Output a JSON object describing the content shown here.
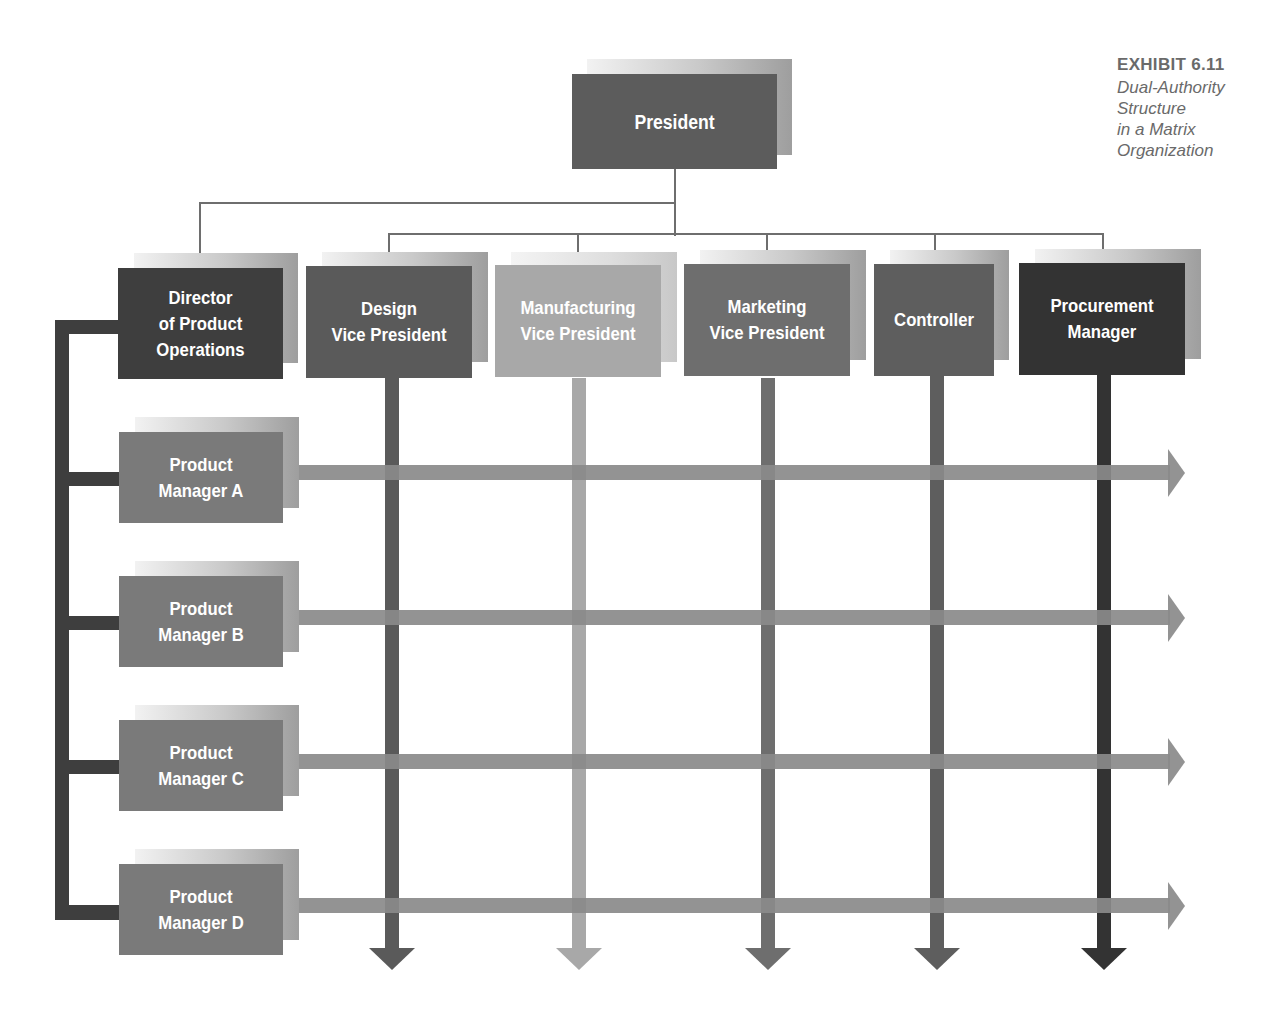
{
  "caption": {
    "exhibit": "EXHIBIT 6.11",
    "title_line1": "Dual-Authority Structure",
    "title_line2": "in a Matrix Organization"
  },
  "top": {
    "label": "President",
    "color": "#5c5c5c"
  },
  "executives": [
    {
      "label": "Director\nof Product\nOperations",
      "color": "#3e3e3e"
    },
    {
      "label": "Design\nVice President",
      "color": "#5a5a5a"
    },
    {
      "label": "Manufacturing\nVice President",
      "color": "#a8a8a8"
    },
    {
      "label": "Marketing\nVice President",
      "color": "#6e6e6e"
    },
    {
      "label": "Controller",
      "color": "#5e5e5e"
    },
    {
      "label": "Procurement\nManager",
      "color": "#333333"
    }
  ],
  "product_managers": [
    {
      "label": "Product\nManager A",
      "color": "#7a7a7a"
    },
    {
      "label": "Product\nManager B",
      "color": "#7a7a7a"
    },
    {
      "label": "Product\nManager C",
      "color": "#7a7a7a"
    },
    {
      "label": "Product\nManager D",
      "color": "#7a7a7a"
    }
  ],
  "colors": {
    "connector": "#6e6e6e",
    "horizontal_arrow": "#8a8a8a",
    "left_bracket": "#3e3e3e"
  }
}
